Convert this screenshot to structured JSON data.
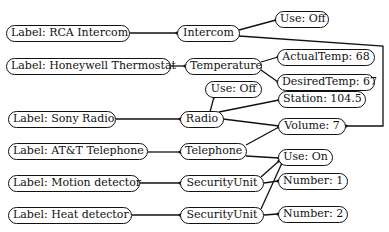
{
  "diagram": {
    "nodes": [
      {
        "id": "label_rca",
        "text": "Label: RCA Intercom",
        "x": 6,
        "y": 25,
        "w": 124
      },
      {
        "id": "intercom",
        "text": "Intercom",
        "x": 177,
        "y": 25,
        "w": 63
      },
      {
        "id": "use_off_1",
        "text": "Use: Off",
        "x": 275,
        "y": 11,
        "w": 54
      },
      {
        "id": "label_honeywell",
        "text": "Label: Honeywell Thermostat",
        "x": 6,
        "y": 58,
        "w": 165
      },
      {
        "id": "temperature",
        "text": "Temperature",
        "x": 185,
        "y": 58,
        "w": 77
      },
      {
        "id": "actualtemp",
        "text": "ActualTemp: 68",
        "x": 277,
        "y": 49,
        "w": 98
      },
      {
        "id": "desiredtemp",
        "text": "DesiredTemp: 67",
        "x": 277,
        "y": 74,
        "w": 98
      },
      {
        "id": "use_off_2",
        "text": "Use: Off",
        "x": 205,
        "y": 81,
        "w": 57
      },
      {
        "id": "station",
        "text": "Station: 104.5",
        "x": 278,
        "y": 91,
        "w": 88
      },
      {
        "id": "label_sony",
        "text": "Label: Sony Radio",
        "x": 8,
        "y": 111,
        "w": 108
      },
      {
        "id": "radio",
        "text": "Radio",
        "x": 180,
        "y": 111,
        "w": 44
      },
      {
        "id": "volume",
        "text": "Volume: 7",
        "x": 278,
        "y": 118,
        "w": 68
      },
      {
        "id": "label_att",
        "text": "Label: AT&T Telephone",
        "x": 8,
        "y": 143,
        "w": 140
      },
      {
        "id": "telephone",
        "text": "Telephone",
        "x": 180,
        "y": 143,
        "w": 67
      },
      {
        "id": "use_on",
        "text": "Use: On",
        "x": 278,
        "y": 149,
        "w": 55
      },
      {
        "id": "label_motion",
        "text": "Label: Motion detector",
        "x": 8,
        "y": 175,
        "w": 132
      },
      {
        "id": "security1",
        "text": "SecurityUnit",
        "x": 180,
        "y": 175,
        "w": 84
      },
      {
        "id": "number1",
        "text": "Number: 1",
        "x": 278,
        "y": 173,
        "w": 70
      },
      {
        "id": "label_heat",
        "text": "Label: Heat detector",
        "x": 8,
        "y": 207,
        "w": 124
      },
      {
        "id": "security2",
        "text": "SecurityUnit",
        "x": 180,
        "y": 207,
        "w": 84
      },
      {
        "id": "number2",
        "text": "Number: 2",
        "x": 278,
        "y": 206,
        "w": 70
      }
    ],
    "edges": [
      {
        "from": "label_rca",
        "to": "intercom",
        "d": "M130,33 L177,33"
      },
      {
        "from": "intercom",
        "to": "use_off_1",
        "d": "M239,30 L276,20"
      },
      {
        "from": "intercom",
        "to": "volume",
        "d": "M239,36 L383,46 L383,126 L346,126"
      },
      {
        "from": "label_honeywell",
        "to": "temperature",
        "d": "M171,66 L185,66"
      },
      {
        "from": "temperature",
        "to": "actualtemp",
        "d": "M261,62 L278,57"
      },
      {
        "from": "temperature",
        "to": "desiredtemp",
        "d": "M261,70 L278,82"
      },
      {
        "from": "label_sony",
        "to": "radio",
        "d": "M116,119 L180,119"
      },
      {
        "from": "radio",
        "to": "use_off_2",
        "d": "M210,112 L214,97"
      },
      {
        "from": "radio",
        "to": "station",
        "d": "M219,112 L279,100"
      },
      {
        "from": "radio",
        "to": "volume",
        "d": "M223,119 L279,126"
      },
      {
        "from": "label_att",
        "to": "telephone",
        "d": "M148,152 L180,152"
      },
      {
        "from": "telephone",
        "to": "volume",
        "d": "M246,145 L279,127"
      },
      {
        "from": "telephone",
        "to": "use_on",
        "d": "M246,156 L279,158"
      },
      {
        "from": "label_motion",
        "to": "security1",
        "d": "M140,183 L180,183"
      },
      {
        "from": "security1",
        "to": "use_on",
        "d": "M261,177 L279,161"
      },
      {
        "from": "security1",
        "to": "number1",
        "d": "M264,183 L278,181"
      },
      {
        "from": "label_heat",
        "to": "security2",
        "d": "M132,215 L180,215"
      },
      {
        "from": "security2",
        "to": "use_on",
        "d": "M261,209 L282,163"
      },
      {
        "from": "security2",
        "to": "number2",
        "d": "M264,215 L278,214"
      }
    ],
    "colors": {
      "stroke": "#111111",
      "background": "#ffffff"
    }
  }
}
